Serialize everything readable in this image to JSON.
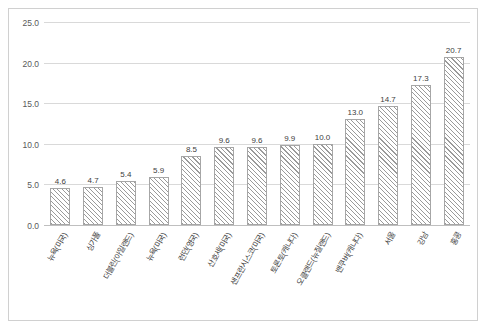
{
  "chart_data": {
    "type": "bar",
    "title": "",
    "xlabel": "",
    "ylabel": "",
    "ylim": [
      0,
      25
    ],
    "yticks": [
      "0.0",
      "5.0",
      "10.0",
      "15.0",
      "20.0",
      "25.0"
    ],
    "grid": true,
    "legend": "none",
    "categories": [
      "뉴욕(미국)",
      "싱가폴",
      "더블린(아일랜드)",
      "뉴욕(미국)",
      "런던(영국)",
      "산호세(미국)",
      "샌프란시스코(미국)",
      "토론토(캐나다)",
      "오클랜드(뉴질랜드)",
      "밴쿠버(캐나다)",
      "서울",
      "강남",
      "홍콩"
    ],
    "values": [
      4.6,
      4.7,
      5.4,
      5.9,
      8.5,
      9.6,
      9.6,
      9.9,
      10.0,
      13.0,
      14.7,
      17.3,
      20.7
    ],
    "value_labels": [
      "4.6",
      "4.7",
      "5.4",
      "5.9",
      "8.5",
      "9.6",
      "9.6",
      "9.9",
      "10.0",
      "13.0",
      "14.7",
      "17.3",
      "20.7"
    ],
    "colors": {
      "bar_fill": "#ffffff",
      "bar_hatch": "#9a9a9a",
      "bar_border": "#a6a6a6",
      "gridline": "#d9d9d9",
      "frame": "#d0d0d0",
      "text": "#404040"
    }
  }
}
